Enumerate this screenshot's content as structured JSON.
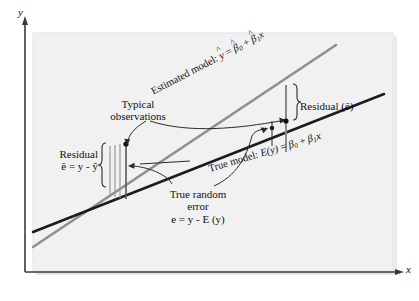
{
  "figure": {
    "kind": "regression-diagram",
    "background_color": "#ffffff",
    "panel_color": "#f2f2f2",
    "axes": {
      "y_label": "y",
      "x_label": "x"
    },
    "lines": [
      {
        "id": "estimated-model",
        "label": "Estimated model:",
        "equation_parts": {
          "response": "y",
          "response_hat": "^",
          "equals": "=",
          "intercept": "β",
          "intercept_sub": "0",
          "intercept_hat": "^",
          "plus": "+",
          "slope": "β",
          "slope_sub": "1",
          "slope_hat": "^",
          "predictor": "x"
        },
        "color": "#8c8c8c"
      },
      {
        "id": "true-model",
        "label": "True model:",
        "equation_parts": {
          "response": "E(y)",
          "equals": "=",
          "intercept": "β",
          "intercept_sub": "0",
          "plus": "+",
          "slope": "β",
          "slope_sub": "1",
          "predictor": "x"
        },
        "color": "#1a1a1a"
      }
    ],
    "annotations": {
      "typical_observations": "Typical\nobservations",
      "typical_observations_line1": "Typical",
      "typical_observations_line2": "observations",
      "residual_right": "Residual (ê)",
      "residual_left_line1": "Residual",
      "residual_left_formula": "ê = y - ŷ",
      "true_error_line1": "True random",
      "true_error_line2": "error",
      "true_error_formula": "e = y - E (y)"
    }
  }
}
